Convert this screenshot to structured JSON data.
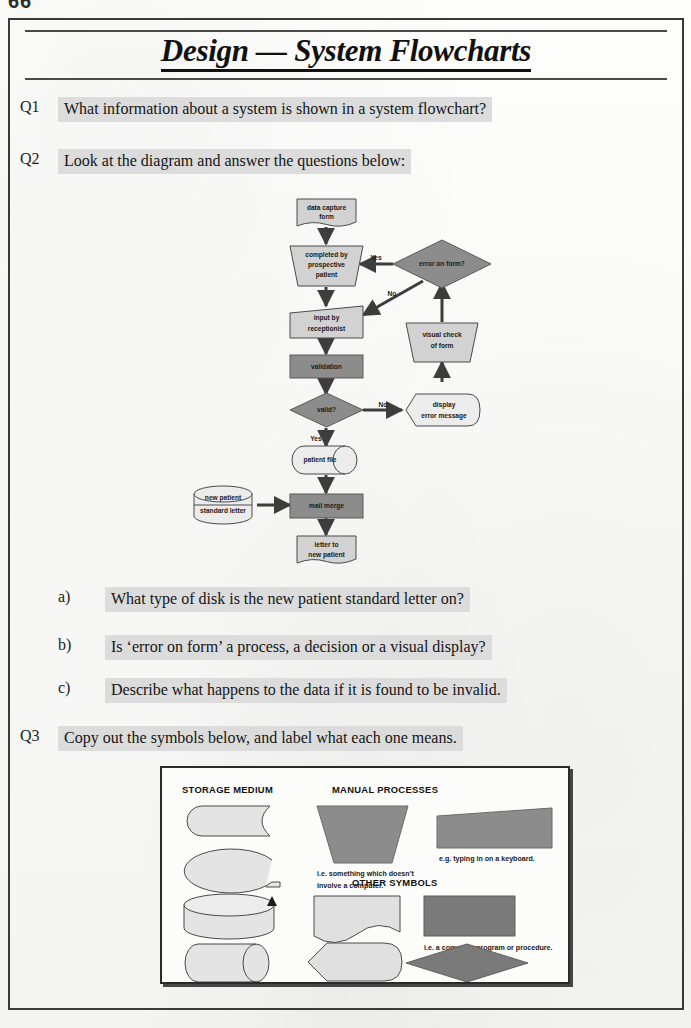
{
  "page": {
    "page_number": "66",
    "title": "Design — System Flowcharts",
    "title_part_1": "Design",
    "title_part_2": "— System Flowcharts"
  },
  "colors": {
    "shape_light": "#d2d2d2",
    "shape_dark": "#8c8c8c",
    "shape_stroke": "#4a4a4a",
    "highlight": "#dcdcdc",
    "ink": "#151515",
    "frame": "#3a3a3a"
  },
  "questions": [
    {
      "number": "Q1",
      "text": "What information about a system is shown in a system flowchart?"
    },
    {
      "number": "Q2",
      "text": "Look at the diagram and answer the questions below:",
      "parts": [
        {
          "number": "a)",
          "text": "What type of disk is the new patient standard letter on?"
        },
        {
          "number": "b)",
          "text": "Is ‘error on form’ a process, a decision or a visual display?"
        },
        {
          "number": "c)",
          "text": "Describe what happens to the data if it is found to be invalid."
        }
      ]
    },
    {
      "number": "Q3",
      "text": "Copy out the symbols below, and label what each one means."
    }
  ],
  "flowchart": {
    "nodes": [
      {
        "id": "data-capture-form",
        "label_line1": "data capture",
        "label_line2": "form",
        "shape": "document",
        "fill": "light"
      },
      {
        "id": "completed-by-prospective-patient",
        "label_line1": "completed by",
        "label_line2": "prospective",
        "label_line3": "patient",
        "shape": "manual-operation",
        "fill": "light"
      },
      {
        "id": "error-on-form",
        "label_line1": "error on form?",
        "shape": "decision",
        "fill": "dark"
      },
      {
        "id": "input-by-receptionist",
        "label_line1": "input by",
        "label_line2": "receptionist",
        "shape": "manual-input",
        "fill": "light"
      },
      {
        "id": "visual-check-of-form",
        "label_line1": "visual check",
        "label_line2": "of form",
        "shape": "manual-operation",
        "fill": "light"
      },
      {
        "id": "validation",
        "label_line1": "validation",
        "shape": "process",
        "fill": "dark"
      },
      {
        "id": "valid",
        "label_line1": "valid?",
        "shape": "decision",
        "fill": "dark"
      },
      {
        "id": "display-error-message",
        "label_line1": "display",
        "label_line2": "error message",
        "shape": "display",
        "fill": "light"
      },
      {
        "id": "patient-file",
        "label_line1": "patient file",
        "shape": "magnetic-disk",
        "fill": "light"
      },
      {
        "id": "new-patient-standard-letter",
        "label_line1": "new patient",
        "label_line2": "standard letter",
        "shape": "magnetic-drum",
        "fill": "light"
      },
      {
        "id": "mail-merge",
        "label_line1": "mail merge",
        "shape": "process",
        "fill": "dark"
      },
      {
        "id": "letter-to-new-patient",
        "label_line1": "letter to",
        "label_line2": "new patient",
        "shape": "document",
        "fill": "light"
      }
    ],
    "edge_labels": {
      "yes": "Yes",
      "no_top": "No",
      "no_valid": "No",
      "yes_valid": "Yes"
    }
  },
  "symbols_panel": {
    "headings": {
      "storage": "STORAGE MEDIUM",
      "manual": "MANUAL PROCESSES",
      "other": "OTHER SYMBOLS"
    },
    "notes": {
      "manual_note_line1": "i.e. something which doesn’t",
      "manual_note_line2": "involve a computer.",
      "keyboard_note": "e.g. typing in on a keyboard.",
      "program_note": "i.e. a computer program or procedure."
    },
    "symbols": [
      {
        "id": "magnetic-tape",
        "group": "storage"
      },
      {
        "id": "magnetic-tape-reel",
        "group": "storage"
      },
      {
        "id": "magnetic-disk",
        "group": "storage"
      },
      {
        "id": "magnetic-drum",
        "group": "storage"
      },
      {
        "id": "manual-operation-trapezoid",
        "group": "manual"
      },
      {
        "id": "manual-input-slanted",
        "group": "manual"
      },
      {
        "id": "document-wavy",
        "group": "other"
      },
      {
        "id": "process-rectangle",
        "group": "other"
      },
      {
        "id": "display-hexagon",
        "group": "other"
      },
      {
        "id": "decision-diamond",
        "group": "other"
      }
    ]
  }
}
